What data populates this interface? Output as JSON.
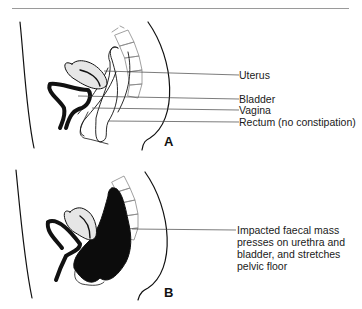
{
  "figure": {
    "panels": [
      {
        "id": "A",
        "letter": "A",
        "labels": [
          {
            "text": "Uterus"
          },
          {
            "text": "Bladder"
          },
          {
            "text": "Vagina"
          },
          {
            "text": "Rectum (no constipation)"
          }
        ]
      },
      {
        "id": "B",
        "letter": "B",
        "labels": [
          {
            "text": "Impacted faecal mass presses on urethra and bladder, and stretches pelvic floor"
          }
        ]
      }
    ]
  }
}
